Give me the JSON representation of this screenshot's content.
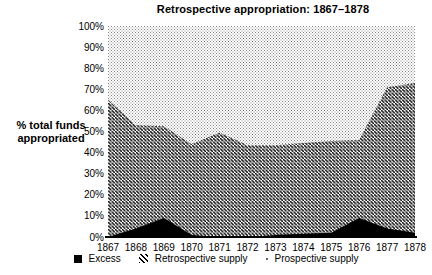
{
  "title": "Retrospective appropriation: 1867–1878",
  "y_axis": {
    "label_line1": "% total funds",
    "label_line2": "appropriated",
    "ticks": [
      "100%",
      "90%",
      "80%",
      "70%",
      "60%",
      "50%",
      "40%",
      "30%",
      "20%",
      "10%",
      "0%"
    ]
  },
  "x_axis": {
    "ticks": [
      "1867",
      "1868",
      "1869",
      "1870",
      "1871",
      "1872",
      "1873",
      "1874",
      "1875",
      "1876",
      "1877",
      "1878"
    ]
  },
  "legend": [
    {
      "label": "Excess",
      "marker": "black-square"
    },
    {
      "label": "Retrospective supply",
      "marker": "diagonal-hatch"
    },
    {
      "label": "Prospective supply",
      "marker": "dot"
    }
  ],
  "chart_data": {
    "type": "area",
    "stacked": true,
    "percent_stacked": true,
    "title": "Retrospective appropriation: 1867–1878",
    "ylabel": "% total funds appropriated",
    "ylim": [
      0,
      100
    ],
    "y_tick_step": 10,
    "grid": false,
    "legend_position": "bottom",
    "x": [
      1867,
      1868,
      1869,
      1870,
      1871,
      1872,
      1873,
      1874,
      1875,
      1876,
      1877,
      1878
    ],
    "series": [
      {
        "name": "Excess",
        "fill": "solid-black",
        "values": [
          0,
          4,
          9,
          1,
          0,
          0,
          1,
          1.5,
          2,
          9,
          4,
          2
        ]
      },
      {
        "name": "Retrospective supply",
        "fill": "diagonal-hatch",
        "values": [
          65,
          49,
          43.5,
          43,
          49.5,
          43.5,
          42.5,
          43,
          43.5,
          37,
          67,
          71
        ]
      },
      {
        "name": "Prospective supply",
        "fill": "dots",
        "values": [
          35,
          47,
          47.5,
          56,
          50.5,
          56.5,
          56.5,
          55.5,
          54.5,
          54,
          29,
          27
        ]
      }
    ]
  },
  "colors": {
    "ink": "#000000",
    "hatch_line": "#111111",
    "dot_fill": "#888888",
    "background": "#ffffff"
  }
}
